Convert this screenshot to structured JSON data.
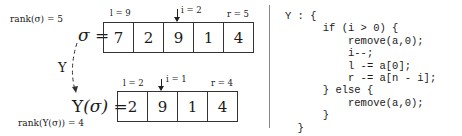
{
  "left": {
    "top": {
      "rank_label": "rank(σ) = 5",
      "eq_symbol": "σ",
      "eq_sign": "=",
      "values": [
        "7",
        "2",
        "9",
        "1",
        "4"
      ],
      "l_label": "l = 9",
      "i_label": "i = 2",
      "r_label": "r = 5",
      "pointer_index": 2
    },
    "transform_label": "Υ",
    "bottom": {
      "eq_prefix": "Υ",
      "eq_arg": "(σ)",
      "eq_sign": "=",
      "rank_label": "rank(Υ(σ)) = 4",
      "values": [
        "2",
        "9",
        "1",
        "4"
      ],
      "l_label": "l = 2",
      "i_label": "i = 1",
      "r_label": "r = 4",
      "pointer_index": 1
    }
  },
  "code": {
    "lines": [
      "Υ : {",
      "      if (i > 0) {",
      "          remove(a,0);",
      "          i--;",
      "          l -= a[0];",
      "          r -= a[n - i];",
      "      } else {",
      "          remove(a,0);",
      "      }",
      "  }"
    ]
  }
}
